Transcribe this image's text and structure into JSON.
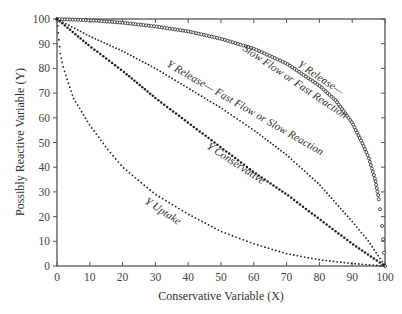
{
  "chart_data": {
    "type": "scatter",
    "title": "",
    "xlabel": "Conservative Variable (X)",
    "ylabel": "Possibly Reactive Variable (Y)",
    "xlim": [
      0,
      100
    ],
    "ylim": [
      0,
      100
    ],
    "xticks": [
      0,
      10,
      20,
      30,
      40,
      50,
      60,
      70,
      80,
      90,
      100
    ],
    "yticks": [
      0,
      10,
      20,
      30,
      40,
      50,
      60,
      70,
      80,
      90,
      100
    ],
    "grid": false,
    "legend": "none (inline curve labels)",
    "series": [
      {
        "name": "Y Release— Slow Flow or Fast Reaction",
        "marker": "open-circle",
        "x": [
          0,
          10,
          20,
          30,
          40,
          50,
          60,
          70,
          80,
          85,
          90,
          93,
          95,
          97,
          98,
          99,
          100
        ],
        "y": [
          100,
          99.5,
          98.5,
          97,
          95,
          92,
          88,
          82,
          73,
          67,
          58,
          50,
          44,
          35,
          28,
          18,
          0
        ]
      },
      {
        "name": "Y Release— Fast Flow or Slow Reaction",
        "marker": "small-dot",
        "x": [
          0,
          10,
          20,
          30,
          40,
          50,
          60,
          70,
          80,
          90,
          95,
          100
        ],
        "y": [
          100,
          93,
          87,
          80,
          72,
          64,
          55,
          45,
          33,
          18,
          10,
          0
        ]
      },
      {
        "name": "Y Conservative",
        "marker": "filled-dot",
        "x": [
          0,
          10,
          20,
          30,
          40,
          50,
          60,
          70,
          80,
          90,
          100
        ],
        "y": [
          100,
          89,
          79,
          68,
          58,
          48,
          38,
          29,
          19,
          9,
          0
        ]
      },
      {
        "name": "Y Uptake",
        "marker": "small-dot",
        "x": [
          0,
          1,
          2,
          5,
          10,
          15,
          20,
          30,
          40,
          50,
          60,
          70,
          80,
          90,
          100
        ],
        "y": [
          100,
          86,
          80,
          68,
          57,
          48,
          40,
          29,
          21,
          14,
          9,
          5,
          2.5,
          1,
          0
        ]
      }
    ],
    "annotations": [
      {
        "text_lines": [
          "Y Release—",
          "Slow Flow or Fast Reaction"
        ],
        "near_series": 0
      },
      {
        "text_lines": [
          "Y Release— Fast Flow or Slow Reaction"
        ],
        "near_series": 1
      },
      {
        "text_lines": [
          "Y Conservative"
        ],
        "near_series": 2
      },
      {
        "text_lines": [
          "Y Uptake"
        ],
        "near_series": 3
      }
    ]
  },
  "labels": {
    "xlabel": "Conservative Variable (X)",
    "ylabel": "Possibly Reactive Variable (Y)",
    "annot_slow_1": "Y Release—",
    "annot_slow_2": "Slow Flow or Fast Reaction",
    "annot_fast": "Y Release— Fast Flow or Slow Reaction",
    "annot_cons": "Y Conservative",
    "annot_uptake": "Y Uptake"
  },
  "colors": {
    "axis": "#555555",
    "points": "#222222"
  }
}
